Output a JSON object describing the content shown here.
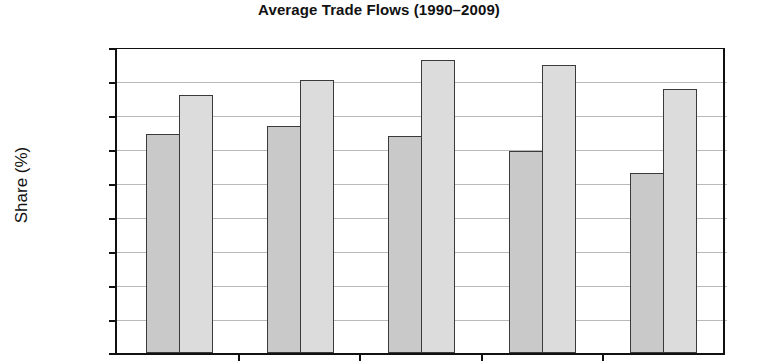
{
  "chart_data": {
    "type": "bar",
    "title": "Average Trade Flows (1990–2009)",
    "xlabel": "",
    "ylabel": "Share (%)",
    "ylim": [
      0,
      90
    ],
    "ytick_step": 10,
    "yticks": [
      "90",
      "80",
      "70",
      "60",
      "50",
      "40",
      "30",
      "20",
      "10",
      "0"
    ],
    "grid": true,
    "legend": "none",
    "categories": [
      "Group 1",
      "Group 2",
      "Group 3",
      "Group 4",
      "Group 5"
    ],
    "series": [
      {
        "name": "Series A",
        "color": "#c9c9c9",
        "values": [
          64.5,
          67.0,
          64.0,
          59.5,
          53.0
        ]
      },
      {
        "name": "Series B",
        "color": "#dcdcdc",
        "values": [
          76.0,
          80.5,
          86.5,
          85.0,
          78.0
        ]
      }
    ],
    "note": "x-axis category labels are cropped out of the screenshot"
  },
  "colors": {
    "axis": "#111111",
    "gridline": "#b9b9b9",
    "bar_outline": "#3a3a3a",
    "background": "#ffffff"
  }
}
